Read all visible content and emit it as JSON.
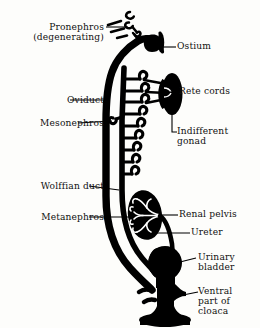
{
  "figure": {
    "ink_color": "#000000",
    "background_color": "#fdfdfb",
    "labels_left": [
      {
        "id": "pronephros",
        "text": "Pronephros\n(degenerating)",
        "x": 14,
        "y": 22,
        "align": "right",
        "width": 90
      },
      {
        "id": "oviduct",
        "text": "Oviduct",
        "x": 38,
        "y": 97,
        "align": "right",
        "width": 66
      },
      {
        "id": "mesonephros",
        "text": "Mesonephros",
        "x": 9,
        "y": 120,
        "align": "right",
        "width": 95
      },
      {
        "id": "wolffian-duct",
        "text": "Wolffian duct",
        "x": 12,
        "y": 183,
        "align": "right",
        "width": 92
      },
      {
        "id": "metanephros",
        "text": "Metanephros",
        "x": 14,
        "y": 214,
        "align": "right",
        "width": 90
      }
    ],
    "labels_right": [
      {
        "id": "ostium",
        "text": "Ostium",
        "x": 170,
        "y": 43,
        "align": "left",
        "width": 86
      },
      {
        "id": "rete-cords",
        "text": "Rete cords",
        "x": 170,
        "y": 88,
        "align": "left",
        "width": 86
      },
      {
        "id": "indifferent-gonad",
        "text": "Indifferent\ngonad",
        "x": 170,
        "y": 126,
        "align": "left",
        "width": 86
      },
      {
        "id": "renal-pelvis",
        "text": "Renal pelvis",
        "x": 172,
        "y": 211,
        "align": "left",
        "width": 86
      },
      {
        "id": "ureter",
        "text": "Ureter",
        "x": 186,
        "y": 228,
        "align": "left",
        "width": 72
      },
      {
        "id": "urinary-bladder",
        "text": "Urinary\nbladder",
        "x": 200,
        "y": 255,
        "align": "left",
        "width": 60
      },
      {
        "id": "ventral-cloaca",
        "text": "Ventral\npart of\ncloaca",
        "x": 200,
        "y": 288,
        "align": "left",
        "width": 60
      }
    ],
    "structures": [
      {
        "id": "pronephros-remnant",
        "name": "pronephros-degenerating-fragments"
      },
      {
        "id": "ostium-funnel",
        "name": "ostium-funnel"
      },
      {
        "id": "oviduct-duct",
        "name": "oviduct"
      },
      {
        "id": "wolffian-duct-shape",
        "name": "wolffian-duct"
      },
      {
        "id": "mesonephric-tubules",
        "name": "mesonephric-tubules",
        "count": 9
      },
      {
        "id": "rete-cords-shape",
        "name": "rete-cords",
        "count": 3
      },
      {
        "id": "gonad",
        "name": "indifferent-gonad"
      },
      {
        "id": "metanephros-kidney",
        "name": "metanephros"
      },
      {
        "id": "renal-pelvis-shape",
        "name": "renal-pelvis"
      },
      {
        "id": "ureter-tube",
        "name": "ureter"
      },
      {
        "id": "bladder",
        "name": "urinary-bladder"
      },
      {
        "id": "cloaca",
        "name": "ventral-part-of-cloaca"
      }
    ]
  }
}
